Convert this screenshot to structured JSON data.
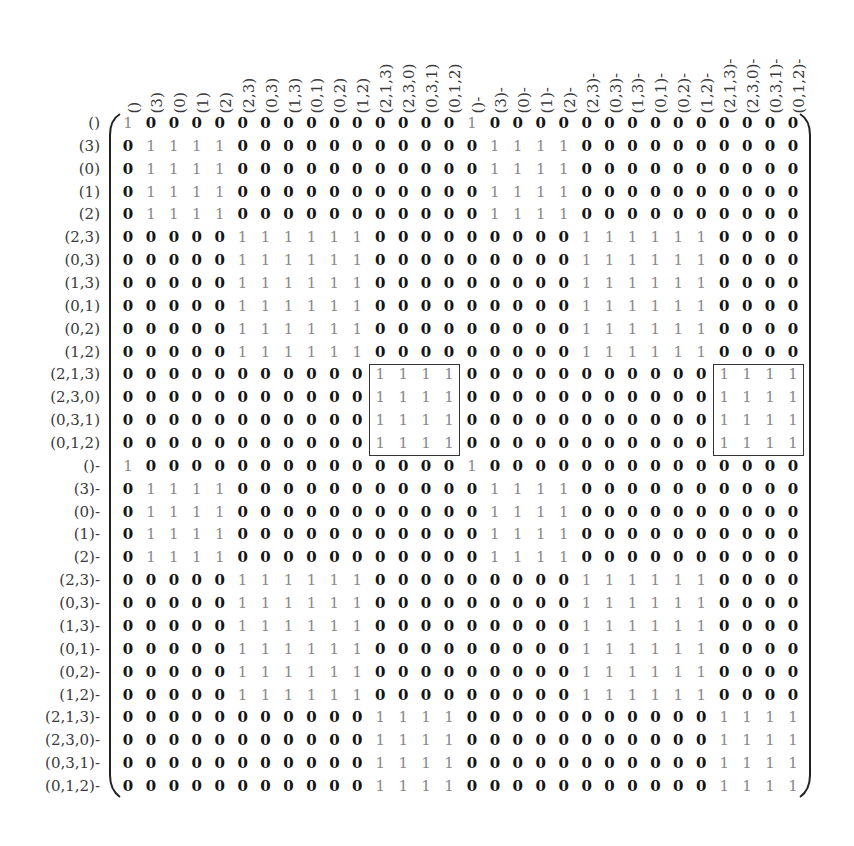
{
  "figure": {
    "type": "block matrix",
    "labels": [
      "()",
      "(3)",
      "(0)",
      "(1)",
      "(2)",
      "(2,3)",
      "(0,3)",
      "(1,3)",
      "(0,1)",
      "(0,2)",
      "(1,2)",
      "(2,1,3)",
      "(2,3,0)",
      "(0,3,1)",
      "(0,1,2)",
      "()-",
      "(3)-",
      "(0)-",
      "(1)-",
      "(2)-",
      "(2,3)-",
      "(0,3)-",
      "(1,3)-",
      "(0,1)-",
      "(0,2)-",
      "(1,2)-",
      "(2,1,3)-",
      "(2,3,0)-",
      "(0,3,1)-",
      "(0,1,2)-"
    ],
    "block_groups": [
      {
        "name": "()",
        "start": 0,
        "size": 1
      },
      {
        "name": "singletons",
        "start": 1,
        "size": 4
      },
      {
        "name": "pairs",
        "start": 5,
        "size": 6
      },
      {
        "name": "triples",
        "start": 11,
        "size": 4
      },
      {
        "name": "()-",
        "start": 15,
        "size": 1
      },
      {
        "name": "singletons-",
        "start": 16,
        "size": 4
      },
      {
        "name": "pairs-",
        "start": 20,
        "size": 6
      },
      {
        "name": "triples-",
        "start": 26,
        "size": 4
      }
    ],
    "highlight_boxes": [
      {
        "rows": [
          11,
          14
        ],
        "cols": [
          11,
          14
        ],
        "content": "all ones"
      },
      {
        "rows": [
          11,
          14
        ],
        "cols": [
          26,
          29
        ],
        "content": "all zeros"
      }
    ],
    "colors": {
      "zero": "#151515",
      "one": "#8a8a8a",
      "label": "#3a3a3a",
      "box": "#333333"
    }
  }
}
